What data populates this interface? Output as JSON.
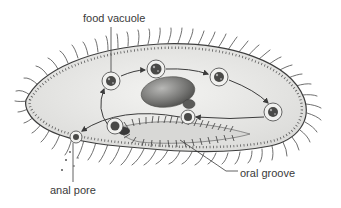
{
  "figure": {
    "labels": {
      "food_vacuole": "food vacuole",
      "anal_pore": "anal pore",
      "oral_groove": "oral groove"
    }
  },
  "structures": {
    "cell_body": "cell-body",
    "cilia": "cilia",
    "macronucleus": "macronucleus",
    "micronucleus": "micronucleus",
    "food_vacuole_count": 7,
    "food_vacuole_path_arrows": 6
  },
  "colors": {
    "background": "#ffffff",
    "cytoplasm": "#ececea",
    "cilia": "#4a4a4a",
    "nucleus": "#6e6e6c",
    "label_text": "#3a3a3a"
  }
}
